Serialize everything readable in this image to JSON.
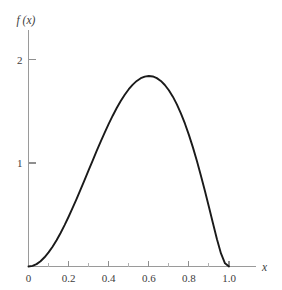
{
  "chart_data": {
    "type": "line",
    "title": "",
    "subtitle": "",
    "xlabel": "x",
    "ylabel": "f (x)",
    "xlim": [
      0,
      1.12
    ],
    "ylim": [
      0,
      2.28
    ],
    "grid": false,
    "legend": null,
    "x_ticks": [
      {
        "value": 0,
        "label": "0",
        "type": "major"
      },
      {
        "value": 0.1,
        "label": "",
        "type": "minor"
      },
      {
        "value": 0.2,
        "label": "0.2",
        "type": "major"
      },
      {
        "value": 0.3,
        "label": "",
        "type": "minor"
      },
      {
        "value": 0.4,
        "label": "0.4",
        "type": "major"
      },
      {
        "value": 0.5,
        "label": "",
        "type": "minor"
      },
      {
        "value": 0.6,
        "label": "0.6",
        "type": "major"
      },
      {
        "value": 0.7,
        "label": "",
        "type": "minor"
      },
      {
        "value": 0.8,
        "label": "0.8",
        "type": "major"
      },
      {
        "value": 0.9,
        "label": "",
        "type": "minor"
      },
      {
        "value": 1.0,
        "label": "1.0",
        "type": "major"
      }
    ],
    "y_ticks": [
      {
        "value": 1,
        "label": "1",
        "type": "major"
      },
      {
        "value": 2,
        "label": "2",
        "type": "major"
      }
    ],
    "series": [
      {
        "name": "f (x)",
        "color": "#1a1a1a",
        "peak": {
          "x": 0.67,
          "y": 1.75
        },
        "x": [
          0.0,
          0.02,
          0.04,
          0.06,
          0.08,
          0.1,
          0.12,
          0.14,
          0.16,
          0.18,
          0.2,
          0.22,
          0.24,
          0.26,
          0.28,
          0.3,
          0.32,
          0.34,
          0.36,
          0.38,
          0.4,
          0.42,
          0.44,
          0.46,
          0.48,
          0.5,
          0.52,
          0.54,
          0.56,
          0.58,
          0.6,
          0.62,
          0.64,
          0.66,
          0.68,
          0.7,
          0.72,
          0.74,
          0.76,
          0.78,
          0.8,
          0.82,
          0.84,
          0.86,
          0.88,
          0.9,
          0.92,
          0.94,
          0.96,
          0.98,
          1.0
        ],
        "y": [
          0.0,
          0.006,
          0.023,
          0.051,
          0.089,
          0.136,
          0.191,
          0.254,
          0.324,
          0.4,
          0.481,
          0.566,
          0.654,
          0.745,
          0.838,
          0.931,
          1.024,
          1.116,
          1.207,
          1.294,
          1.378,
          1.457,
          1.531,
          1.599,
          1.66,
          1.713,
          1.757,
          1.793,
          1.819,
          1.835,
          1.841,
          1.836,
          1.82,
          1.793,
          1.754,
          1.703,
          1.641,
          1.566,
          1.48,
          1.382,
          1.272,
          1.151,
          1.019,
          0.878,
          0.729,
          0.574,
          0.417,
          0.263,
          0.126,
          0.031,
          0.0
        ]
      }
    ]
  }
}
